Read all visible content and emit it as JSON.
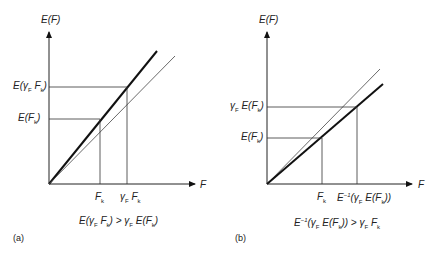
{
  "panels": [
    {
      "id": "a",
      "caption": "(a)",
      "y_axis_label": "E(F)",
      "x_axis_label": "F",
      "y_ticks": [
        "E(γF Fk)",
        "E(Fk)"
      ],
      "x_ticks": [
        "Fk",
        "γF Fk"
      ],
      "inequality": "E(γF Fk) > γF E(Fk)",
      "thick_line": "E(F) convex/steeper curve",
      "thin_line": "linear reference"
    },
    {
      "id": "b",
      "caption": "(b)",
      "y_axis_label": "E(F)",
      "x_axis_label": "F",
      "y_ticks": [
        "γF E(Fk)",
        "E(Fk)"
      ],
      "x_ticks": [
        "Fk",
        "E⁻¹(γF E(Fk))"
      ],
      "inequality": "E⁻¹(γF E(Fk)) > γF Fk",
      "thick_line": "E(F) shallower curve",
      "thin_line": "linear reference"
    }
  ],
  "colors": {
    "line": "#1a1a1a",
    "thin": "#444444",
    "background": "#ffffff"
  }
}
